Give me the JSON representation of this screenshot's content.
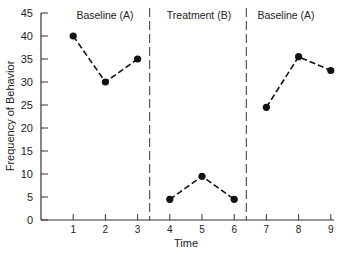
{
  "chart_data": {
    "type": "line",
    "title": "",
    "xlabel": "Time",
    "ylabel": "Frequency of Behavior",
    "x": [
      1,
      2,
      3,
      4,
      5,
      6,
      7,
      8,
      9
    ],
    "xticks": [
      "1",
      "2",
      "3",
      "4",
      "5",
      "6",
      "7",
      "8",
      "9"
    ],
    "yticks": [
      "0",
      "5",
      "10",
      "15",
      "20",
      "25",
      "30",
      "35",
      "40",
      "45"
    ],
    "ylim": [
      0,
      45
    ],
    "xlim": [
      0,
      9
    ],
    "grid": false,
    "phases": [
      {
        "label": "Baseline (A)",
        "x": [
          1,
          2,
          3
        ],
        "values": [
          40,
          30,
          35
        ]
      },
      {
        "label": "Treatment (B)",
        "x": [
          4,
          5,
          6
        ],
        "values": [
          4.5,
          9.5,
          4.5
        ]
      },
      {
        "label": "Baseline (A)",
        "x": [
          7,
          8,
          9
        ],
        "values": [
          24.5,
          35.5,
          32.5
        ]
      }
    ],
    "phase_dividers_x": [
      3.5,
      6.5
    ],
    "style": {
      "line": "dashed",
      "marker": "filled-circle",
      "color": "#111111"
    }
  }
}
